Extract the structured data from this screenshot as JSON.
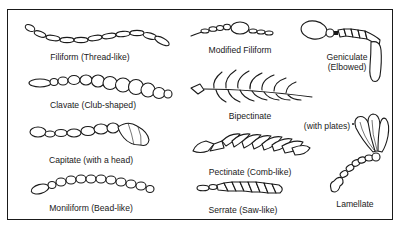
{
  "diagram": {
    "border_color": "#1a1a1a",
    "background_color": "#ffffff",
    "antennae": [
      {
        "id": "filiform",
        "label": "Filiform (Thread-like)"
      },
      {
        "id": "clavate",
        "label": "Clavate (Club-shaped)"
      },
      {
        "id": "capitate",
        "label": "Capitate (with a head)"
      },
      {
        "id": "moniliform",
        "label": "Moniliform (Bead-like)"
      },
      {
        "id": "modified-filiform",
        "label": "Modified Filiform"
      },
      {
        "id": "geniculate",
        "label_line1": "Geniculate",
        "label_line2": "(Elbowed)"
      },
      {
        "id": "bipectinate",
        "label": "Bipectinate"
      },
      {
        "id": "pectinate",
        "label": "Pectinate (Comb-like)"
      },
      {
        "id": "serrate",
        "label": "Serrate (Saw-like)"
      },
      {
        "id": "lamellate",
        "label": "Lamellate",
        "annotation": "(with plates)"
      }
    ]
  }
}
